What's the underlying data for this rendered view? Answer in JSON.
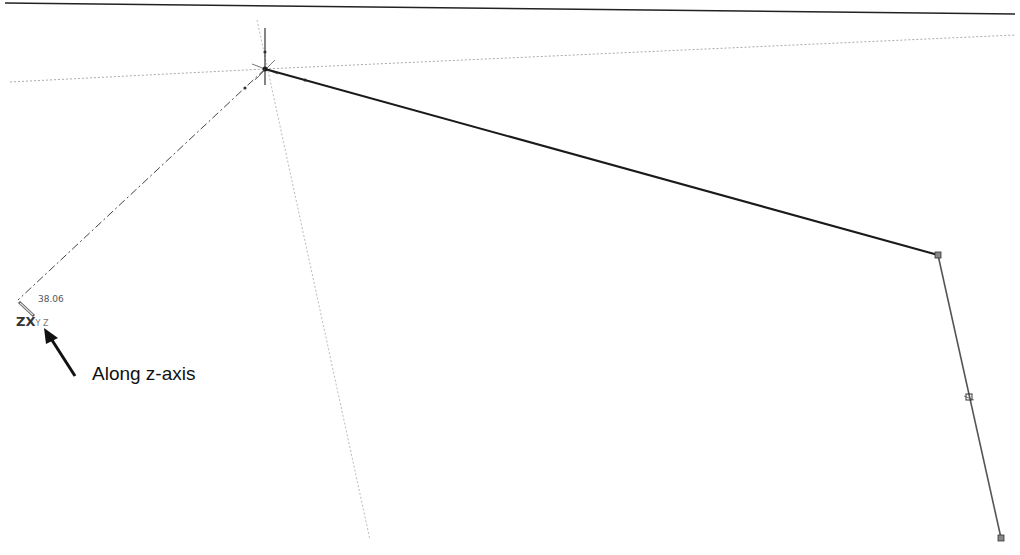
{
  "diagram": {
    "dimension_value": "38.06",
    "cursor_axis_label": "ZX",
    "cursor_axis_suffix": "Y Z",
    "annotation": "Along z-axis",
    "colors": {
      "line": "#1a1a1a",
      "construction": "#999999",
      "arrow": "#111111"
    }
  }
}
